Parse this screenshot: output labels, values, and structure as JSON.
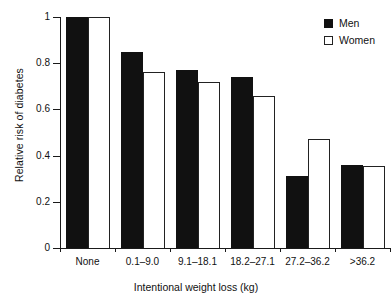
{
  "chart_data": {
    "type": "bar",
    "title": "",
    "xlabel": "Intentional weight loss (kg)",
    "ylabel": "Relative risk of diabetes",
    "categories": [
      "None",
      "0.1–9.0",
      "9.1–18.1",
      "18.2–27.1",
      "27.2–36.2",
      ">36.2"
    ],
    "series": [
      {
        "name": "Men",
        "values": [
          1.0,
          0.85,
          0.77,
          0.74,
          0.31,
          0.36
        ]
      },
      {
        "name": "Women",
        "values": [
          1.0,
          0.76,
          0.72,
          0.66,
          0.47,
          0.355
        ]
      }
    ],
    "ylim": [
      0,
      1
    ],
    "yticks": [
      0,
      0.2,
      0.4,
      0.6,
      0.8,
      1
    ],
    "ytick_labels": [
      "0",
      "0.2",
      "0.4",
      "0.6",
      "0.8",
      "1"
    ],
    "grid": false,
    "legend_position": "top-right",
    "colors": {
      "men": "#111111",
      "women": "#ffffff",
      "axis": "#1a1a1a",
      "text": "#111111"
    }
  }
}
